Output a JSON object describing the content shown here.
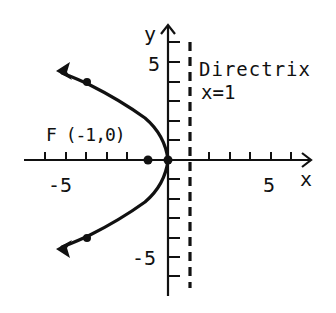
{
  "diagram": {
    "type": "parabola-graph",
    "equation_implied": "y^2 = -4x",
    "axes": {
      "x_label": "x",
      "y_label": "y",
      "x_tick_labels": [
        "-5",
        "5"
      ],
      "y_tick_labels": [
        "5",
        "-5"
      ],
      "x_range": [
        -7,
        7
      ],
      "y_range": [
        -7,
        7
      ]
    },
    "focus": {
      "label": "F (-1,0)",
      "x": -1,
      "y": 0
    },
    "vertex": {
      "x": 0,
      "y": 0
    },
    "directrix": {
      "title": "Directrix",
      "equation": "x=1",
      "x": 1
    },
    "marked_points": [
      {
        "x": -4,
        "y": 4
      },
      {
        "x": -4,
        "y": -4
      },
      {
        "x": -1,
        "y": 0
      },
      {
        "x": 0,
        "y": 0
      }
    ],
    "colors": {
      "ink": "#111111",
      "background": "#ffffff"
    }
  }
}
